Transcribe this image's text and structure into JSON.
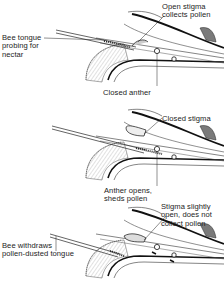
{
  "figure": {
    "panels": [
      {
        "id": "panel-1",
        "stage": "Bee probing",
        "labels": {
          "tongue": [
            "Bee tongue",
            "probing for",
            "nectar"
          ],
          "stigma": [
            "Open stigma",
            "collects pollen"
          ],
          "anther": [
            "Closed anther"
          ]
        }
      },
      {
        "id": "panel-2",
        "stage": "Anther opens",
        "labels": {
          "stigma": [
            "Closed stigma"
          ],
          "anther": [
            "Anther opens,",
            "sheds pollen"
          ]
        }
      },
      {
        "id": "panel-3",
        "stage": "Bee withdraws",
        "labels": {
          "stigma": [
            "Stigma slightly",
            "open, does not",
            "collect pollen"
          ],
          "tongue": [
            "Bee withdraws",
            "pollen-dusted tongue"
          ]
        }
      }
    ],
    "colors": {
      "ink": "#1c1c1c",
      "shade": "#8a8a8a",
      "background": "#ffffff"
    }
  }
}
